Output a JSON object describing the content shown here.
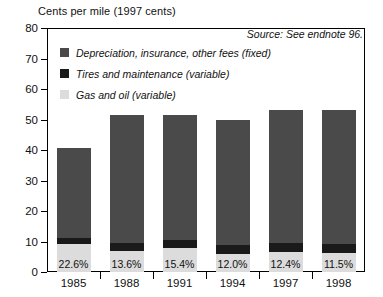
{
  "chart_data": {
    "type": "bar",
    "title": "Cents per mile (1997 cents)",
    "source": "Source: See endnote 96.",
    "xlabel": "",
    "ylabel": "Cents per mile (1997 cents)",
    "ylim": [
      0,
      80
    ],
    "ytick_step": 10,
    "yticks": [
      "0",
      "10",
      "20",
      "30",
      "40",
      "50",
      "60",
      "70",
      "80"
    ],
    "grid": false,
    "stacked": true,
    "legend_position": "upper-left-inside",
    "categories": [
      "1985",
      "1988",
      "1991",
      "1994",
      "1997",
      "1998"
    ],
    "series": [
      {
        "name": "Gas and oil (variable)",
        "color": "#dcdcdc",
        "values": [
          9.2,
          7.0,
          8.0,
          6.0,
          6.6,
          6.1
        ]
      },
      {
        "name": "Tires and maintenance (variable)",
        "color": "#1a1a1a",
        "values": [
          1.8,
          2.4,
          2.4,
          3.0,
          3.0,
          3.0
        ]
      },
      {
        "name": "Depreciation, insurance, other fees (fixed)",
        "color": "#4a4a4a",
        "values": [
          29.5,
          42.1,
          41.1,
          41.0,
          43.4,
          43.9
        ]
      }
    ],
    "totals": [
      40.5,
      51.5,
      51.5,
      50.0,
      53.0,
      53.0
    ],
    "annotations": {
      "label": "Gas and oil share of total",
      "values": [
        "22.6%",
        "13.6%",
        "15.4%",
        "12.0%",
        "12.4%",
        "11.5%"
      ]
    },
    "colors": {
      "fixed": "#4a4a4a",
      "tires": "#1a1a1a",
      "gas": "#dcdcdc",
      "axis": "#000000",
      "background": "#ffffff"
    }
  }
}
